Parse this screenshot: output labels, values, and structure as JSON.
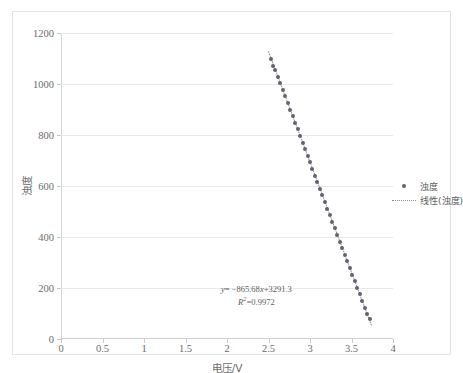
{
  "chart_data": {
    "type": "scatter",
    "title": "",
    "xlabel": "电压/V",
    "ylabel": "浊度",
    "xlim": [
      0,
      4
    ],
    "ylim": [
      0,
      1200
    ],
    "grid": true,
    "legend_position": "right",
    "xticks": [
      "0",
      "0.5",
      "1",
      "1.5",
      "2",
      "2.5",
      "3",
      "3.5",
      "4"
    ],
    "xtick_values": [
      0,
      0.5,
      1,
      1.5,
      2,
      2.5,
      3,
      3.5,
      4
    ],
    "yticks": [
      "0",
      "200",
      "400",
      "600",
      "800",
      "1000",
      "1200"
    ],
    "ytick_values": [
      0,
      200,
      400,
      600,
      800,
      1000,
      1200
    ],
    "series": [
      {
        "name": "浊度",
        "marker": "circle",
        "color": "#60646e",
        "x": [
          2.53,
          2.56,
          2.58,
          2.61,
          2.64,
          2.67,
          2.7,
          2.73,
          2.76,
          2.79,
          2.82,
          2.85,
          2.88,
          2.91,
          2.94,
          2.97,
          3.0,
          3.03,
          3.06,
          3.09,
          3.12,
          3.15,
          3.18,
          3.21,
          3.24,
          3.27,
          3.3,
          3.33,
          3.36,
          3.39,
          3.42,
          3.45,
          3.48,
          3.51,
          3.54,
          3.57,
          3.6,
          3.63,
          3.66,
          3.69,
          3.72
        ],
        "y": [
          1098,
          1072,
          1055,
          1029,
          1003,
          977,
          952,
          926,
          900,
          874,
          848,
          822,
          796,
          770,
          744,
          718,
          693,
          667,
          641,
          615,
          589,
          563,
          537,
          511,
          485,
          459,
          434,
          408,
          382,
          356,
          330,
          304,
          278,
          252,
          226,
          200,
          175,
          149,
          123,
          97,
          80
        ]
      }
    ],
    "trendline": {
      "name": "线性(浊度)",
      "style": "dotted",
      "color": "#8d8d8d",
      "slope": -865.68,
      "intercept": 3291.3,
      "r_squared": 0.9972,
      "x_start": 2.5,
      "x_end": 3.74
    },
    "annotation": {
      "equation_y": "y",
      "equation_body": "= −865.68",
      "equation_x": "x",
      "equation_tail": "+3291.3",
      "r2_label": "R",
      "r2_sup": "2",
      "r2_value": "=0.9972"
    }
  },
  "legend": {
    "items": [
      {
        "label": "浊度",
        "key": "dot-marker"
      },
      {
        "label": "线性(浊度)",
        "key": "dotted-line"
      }
    ]
  }
}
